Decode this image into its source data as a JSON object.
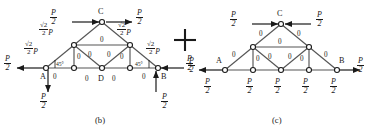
{
  "figure": {
    "type": "truss-force-decomposition-diagram",
    "panels": [
      {
        "id": "b",
        "caption": "(b)",
        "node_labels": [
          "A",
          "B",
          "C",
          "D"
        ],
        "angle_labels": [
          "45°",
          "45°"
        ],
        "member_forces": [
          "0",
          "0",
          "0",
          "0",
          "0",
          "0",
          "0",
          "0",
          "0",
          "0",
          "0"
        ],
        "diagonal_force_labels": [
          {
            "value": "√2/2 P",
            "numerator": "√2",
            "denominator": "2",
            "suffix": "P",
            "position": "lower-left"
          },
          {
            "value": "√2/2 P",
            "numerator": "√2",
            "denominator": "2",
            "suffix": "P",
            "position": "upper-left"
          },
          {
            "value": "√2/2 P",
            "numerator": "√2",
            "denominator": "2",
            "suffix": "P",
            "position": "upper-right"
          },
          {
            "value": "√2/2 P",
            "numerator": "√2",
            "denominator": "2",
            "suffix": "P",
            "position": "lower-right"
          }
        ],
        "loads": [
          {
            "label": "P/2",
            "numerator": "P",
            "denominator": "2",
            "direction": "right",
            "at": "top-left-of-C"
          },
          {
            "label": "P/2",
            "numerator": "P",
            "denominator": "2",
            "direction": "right",
            "at": "top-right-of-C"
          },
          {
            "label": "P/2",
            "numerator": "P",
            "denominator": "2",
            "direction": "left",
            "at": "node-A-horizontal"
          },
          {
            "label": "P/2",
            "numerator": "P",
            "denominator": "2",
            "direction": "down",
            "at": "node-A-vertical"
          },
          {
            "label": "P/2",
            "numerator": "P",
            "denominator": "2",
            "direction": "left",
            "at": "node-B-horizontal"
          },
          {
            "label": "P/2",
            "numerator": "P",
            "denominator": "2",
            "direction": "up",
            "at": "node-B-vertical"
          }
        ]
      },
      {
        "id": "c",
        "caption": "(c)",
        "node_labels": [
          "A",
          "B",
          "C"
        ],
        "member_forces": [
          "0",
          "0",
          "0",
          "0",
          "0",
          "0",
          "0",
          "0",
          "0"
        ],
        "loads": [
          {
            "label": "P/2",
            "numerator": "P",
            "denominator": "2",
            "direction": "right",
            "at": "top-left-of-C"
          },
          {
            "label": "P/2",
            "numerator": "P",
            "denominator": "2",
            "direction": "left",
            "at": "top-right-of-C"
          },
          {
            "label": "P/2",
            "numerator": "P",
            "denominator": "2",
            "direction": "left",
            "at": "node-A-horizontal"
          },
          {
            "label": "P/2",
            "numerator": "P",
            "denominator": "2",
            "direction": "right",
            "at": "node-B-horizontal"
          },
          {
            "label": "P/2",
            "numerator": "P",
            "denominator": "2",
            "direction": "none",
            "at": "bottom-node-1"
          },
          {
            "label": "P/2",
            "numerator": "P",
            "denominator": "2",
            "direction": "none",
            "at": "bottom-node-2"
          },
          {
            "label": "P/2",
            "numerator": "P",
            "denominator": "2",
            "direction": "none",
            "at": "bottom-node-3"
          },
          {
            "label": "P/2",
            "numerator": "P",
            "denominator": "2",
            "direction": "none",
            "at": "bottom-node-4"
          },
          {
            "label": "P/2",
            "numerator": "P",
            "denominator": "2",
            "direction": "none",
            "at": "bottom-node-A"
          }
        ]
      }
    ],
    "operator": "+",
    "symbols": {
      "P": "P",
      "two": "2",
      "sqrt2": "√2",
      "zero": "0",
      "angle45": "45°",
      "plus": "+",
      "nodeA": "A",
      "nodeB": "B",
      "nodeC": "C",
      "nodeD": "D",
      "capB": "(b)",
      "capC": "(c)"
    },
    "colors": {
      "ink": "#1a1a1a",
      "member": "#4a4a4a",
      "background": "#ffffff"
    }
  }
}
